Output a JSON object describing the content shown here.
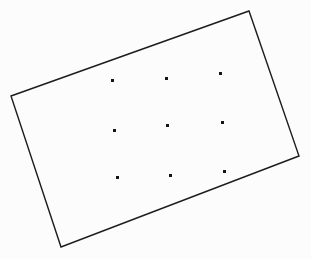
{
  "figure": {
    "canvas": {
      "width": 311,
      "height": 259
    },
    "background_color": "#fcfcfc",
    "stroke_color": "#1c1c1c",
    "stroke_width": 1.4,
    "dot_color": "#141414",
    "dot_size": 3,
    "shape": {
      "name": "rotated-rectangle",
      "type": "quadrilateral",
      "vertex_count": 4,
      "rotation_note": "rectangle rotated counter-clockwise roughly 20 degrees",
      "vertices": [
        {
          "label": "left",
          "x": 11,
          "y": 96
        },
        {
          "label": "top",
          "x": 249,
          "y": 11
        },
        {
          "label": "right",
          "x": 299,
          "y": 156
        },
        {
          "label": "bottom",
          "x": 61,
          "y": 247
        }
      ],
      "points_path": "11,96 249,11 299,156 61,247"
    },
    "dot_grid": {
      "rows": 3,
      "columns": 3,
      "count": 9,
      "points": [
        {
          "row": 1,
          "col": 1,
          "x": 112,
          "y": 80
        },
        {
          "row": 1,
          "col": 2,
          "x": 166,
          "y": 78
        },
        {
          "row": 1,
          "col": 3,
          "x": 220,
          "y": 73
        },
        {
          "row": 2,
          "col": 1,
          "x": 114,
          "y": 130
        },
        {
          "row": 2,
          "col": 2,
          "x": 167,
          "y": 125
        },
        {
          "row": 2,
          "col": 3,
          "x": 222,
          "y": 122
        },
        {
          "row": 3,
          "col": 1,
          "x": 117,
          "y": 177
        },
        {
          "row": 3,
          "col": 2,
          "x": 170,
          "y": 175
        },
        {
          "row": 3,
          "col": 3,
          "x": 224,
          "y": 171
        }
      ]
    }
  },
  "chart_data": {
    "type": "scatter",
    "xlabel": "",
    "ylabel": "",
    "xlim": [
      0,
      311
    ],
    "ylim": [
      0,
      259
    ],
    "grid": false,
    "legend": "none",
    "series": [
      {
        "name": "dot-grid",
        "marker": "square",
        "color": "#141414",
        "x": [
          112,
          166,
          220,
          114,
          167,
          222,
          117,
          170,
          224
        ],
        "y": [
          80,
          78,
          73,
          130,
          125,
          122,
          177,
          175,
          171
        ]
      }
    ],
    "annotations": [
      {
        "name": "rotated-rectangle-outline",
        "type": "polygon",
        "closed": true,
        "color": "#1c1c1c",
        "x": [
          11,
          249,
          299,
          61
        ],
        "y": [
          96,
          11,
          156,
          247
        ]
      }
    ]
  }
}
